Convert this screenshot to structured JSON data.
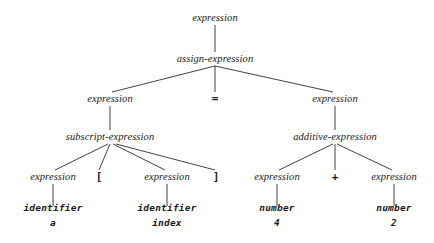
{
  "diagram": {
    "background_color": "#ffffff",
    "text_color": "#1a1a1a",
    "edge_color": "#2b2b2b",
    "nodes": [
      {
        "id": "n0",
        "label": "expression",
        "kind": "nonterminal",
        "x": 215,
        "y": 18
      },
      {
        "id": "n1",
        "label": "assign-expression",
        "kind": "nonterminal",
        "x": 215,
        "y": 59
      },
      {
        "id": "n2",
        "label": "expression",
        "kind": "nonterminal",
        "x": 110,
        "y": 99
      },
      {
        "id": "n3",
        "label": "=",
        "kind": "terminal",
        "x": 215,
        "y": 99
      },
      {
        "id": "n4",
        "label": "expression",
        "kind": "nonterminal",
        "x": 335,
        "y": 99
      },
      {
        "id": "n5",
        "label": "subscript-expression",
        "kind": "nonterminal",
        "x": 110,
        "y": 137
      },
      {
        "id": "n6",
        "label": "additive-expression",
        "kind": "nonterminal",
        "x": 335,
        "y": 137
      },
      {
        "id": "n7",
        "label": "expression",
        "kind": "nonterminal",
        "x": 53,
        "y": 177
      },
      {
        "id": "n8",
        "label": "[",
        "kind": "terminal",
        "x": 99,
        "y": 177
      },
      {
        "id": "n9",
        "label": "expression",
        "kind": "nonterminal",
        "x": 167,
        "y": 177
      },
      {
        "id": "n10",
        "label": "]",
        "kind": "terminal",
        "x": 216,
        "y": 177
      },
      {
        "id": "n11",
        "label": "expression",
        "kind": "nonterminal",
        "x": 277,
        "y": 177
      },
      {
        "id": "n12",
        "label": "+",
        "kind": "terminal",
        "x": 335,
        "y": 177
      },
      {
        "id": "n13",
        "label": "expression",
        "kind": "nonterminal",
        "x": 394,
        "y": 177
      }
    ],
    "leaves": [
      {
        "id": "l0",
        "type": "identifier",
        "value": "a",
        "x": 53,
        "y": 216
      },
      {
        "id": "l1",
        "type": "identifier",
        "value": "index",
        "x": 167,
        "y": 216
      },
      {
        "id": "l2",
        "type": "number",
        "value": "4",
        "x": 277,
        "y": 216
      },
      {
        "id": "l3",
        "type": "number",
        "value": "2",
        "x": 394,
        "y": 216
      }
    ],
    "edges": [
      {
        "from": "n0",
        "to": "n1",
        "x1": 215,
        "y1": 25,
        "x2": 215,
        "y2": 52
      },
      {
        "from": "n1",
        "to": "n2",
        "x1": 215,
        "y1": 66,
        "x2": 112,
        "y2": 92
      },
      {
        "from": "n1",
        "to": "n3",
        "x1": 215,
        "y1": 66,
        "x2": 215,
        "y2": 92
      },
      {
        "from": "n1",
        "to": "n4",
        "x1": 215,
        "y1": 66,
        "x2": 333,
        "y2": 92
      },
      {
        "from": "n2",
        "to": "n5",
        "x1": 110,
        "y1": 106,
        "x2": 110,
        "y2": 130
      },
      {
        "from": "n4",
        "to": "n6",
        "x1": 335,
        "y1": 106,
        "x2": 335,
        "y2": 130
      },
      {
        "from": "n5",
        "to": "n7",
        "x1": 108,
        "y1": 144,
        "x2": 55,
        "y2": 170
      },
      {
        "from": "n5",
        "to": "n8",
        "x1": 110,
        "y1": 144,
        "x2": 99,
        "y2": 170
      },
      {
        "from": "n5",
        "to": "n9",
        "x1": 113,
        "y1": 144,
        "x2": 165,
        "y2": 170
      },
      {
        "from": "n5",
        "to": "n10",
        "x1": 116,
        "y1": 144,
        "x2": 215,
        "y2": 170
      },
      {
        "from": "n6",
        "to": "n11",
        "x1": 333,
        "y1": 144,
        "x2": 279,
        "y2": 170
      },
      {
        "from": "n6",
        "to": "n12",
        "x1": 335,
        "y1": 144,
        "x2": 335,
        "y2": 170
      },
      {
        "from": "n6",
        "to": "n13",
        "x1": 337,
        "y1": 144,
        "x2": 392,
        "y2": 170
      },
      {
        "from": "n7",
        "to": "l0",
        "x1": 53,
        "y1": 184,
        "x2": 53,
        "y2": 206
      },
      {
        "from": "n9",
        "to": "l1",
        "x1": 167,
        "y1": 184,
        "x2": 167,
        "y2": 206
      },
      {
        "from": "n11",
        "to": "l2",
        "x1": 277,
        "y1": 184,
        "x2": 277,
        "y2": 206
      },
      {
        "from": "n13",
        "to": "l3",
        "x1": 394,
        "y1": 184,
        "x2": 394,
        "y2": 206
      }
    ]
  }
}
